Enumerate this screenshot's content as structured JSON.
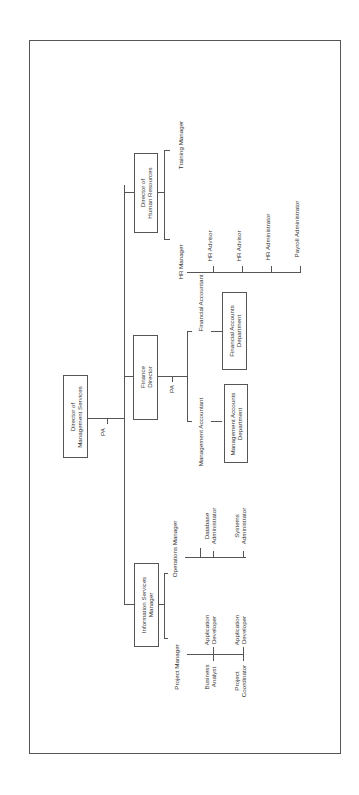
{
  "chart": {
    "orientation": "rotated-90-ccw",
    "root": {
      "title": "Director of Management Services",
      "line1": "Director of",
      "line2": "Management Services",
      "assistant": "PA"
    },
    "branches": [
      {
        "title": "Information Services Manager",
        "line1": "Information Services",
        "line2": "Manager",
        "children": [
          {
            "title": "Project Manager",
            "reports": [
              {
                "l1": "Application",
                "l2": "Developer"
              },
              {
                "l1": "Business",
                "l2": "Analyst"
              },
              {
                "l1": "Application",
                "l2": "Developer"
              },
              {
                "l1": "Project",
                "l2": "Coordinator"
              }
            ]
          },
          {
            "title": "Operations Manager",
            "reports": [
              {
                "l1": "Database",
                "l2": "Administrator"
              },
              {
                "l1": "Systems",
                "l2": "Administrator"
              }
            ]
          }
        ]
      },
      {
        "title": "Finance Director",
        "line1": "Finance",
        "line2": "Director",
        "assistant": "PA",
        "children": [
          {
            "title": "Management Accountant",
            "department": {
              "l1": "Management Accounts",
              "l2": "Department"
            }
          },
          {
            "title": "Financial Accountant",
            "department": {
              "l1": "Financial Accounts",
              "l2": "Department"
            }
          }
        ]
      },
      {
        "title": "Director of Human Resources",
        "line1": "Director of",
        "line2": "Human Resources",
        "children": [
          {
            "title": "HR Manager",
            "reports": [
              "HR Advisor",
              "HR Advisor",
              "HR Administrator",
              "Payroll Administrator"
            ]
          },
          {
            "title": "Training Manager"
          }
        ]
      }
    ]
  }
}
